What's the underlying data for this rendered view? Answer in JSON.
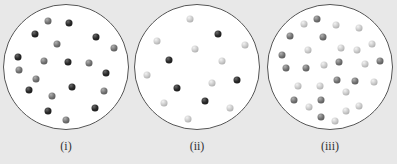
{
  "diagram": {
    "panels": [
      {
        "label": "(i)",
        "circle": {
          "cx": 66,
          "cy": 67,
          "r": 63
        },
        "particles": [
          {
            "x": 69,
            "y": 23,
            "type": "dark"
          },
          {
            "x": 35,
            "y": 34,
            "type": "dark"
          },
          {
            "x": 96,
            "y": 37,
            "type": "dark"
          },
          {
            "x": 18,
            "y": 57,
            "type": "dark"
          },
          {
            "x": 68,
            "y": 62,
            "type": "dark"
          },
          {
            "x": 106,
            "y": 73,
            "type": "dark"
          },
          {
            "x": 29,
            "y": 90,
            "type": "dark"
          },
          {
            "x": 72,
            "y": 87,
            "type": "dark"
          },
          {
            "x": 48,
            "y": 111,
            "type": "dark"
          },
          {
            "x": 95,
            "y": 108,
            "type": "dark"
          },
          {
            "x": 48,
            "y": 21,
            "type": "medium"
          },
          {
            "x": 57,
            "y": 44,
            "type": "medium"
          },
          {
            "x": 114,
            "y": 48,
            "type": "medium"
          },
          {
            "x": 44,
            "y": 61,
            "type": "medium"
          },
          {
            "x": 89,
            "y": 63,
            "type": "medium"
          },
          {
            "x": 19,
            "y": 70,
            "type": "medium"
          },
          {
            "x": 36,
            "y": 79,
            "type": "medium"
          },
          {
            "x": 104,
            "y": 91,
            "type": "medium"
          },
          {
            "x": 52,
            "y": 96,
            "type": "medium"
          },
          {
            "x": 66,
            "y": 120,
            "type": "medium"
          }
        ]
      },
      {
        "label": "(ii)",
        "circle": {
          "cx": 197,
          "cy": 67,
          "r": 63
        },
        "particles": [
          {
            "x": 218,
            "y": 34,
            "type": "dark"
          },
          {
            "x": 169,
            "y": 60,
            "type": "dark"
          },
          {
            "x": 237,
            "y": 80,
            "type": "dark"
          },
          {
            "x": 177,
            "y": 88,
            "type": "dark"
          },
          {
            "x": 205,
            "y": 101,
            "type": "dark"
          },
          {
            "x": 190,
            "y": 19,
            "type": "light"
          },
          {
            "x": 157,
            "y": 41,
            "type": "light"
          },
          {
            "x": 245,
            "y": 45,
            "type": "light"
          },
          {
            "x": 195,
            "y": 49,
            "type": "light"
          },
          {
            "x": 222,
            "y": 61,
            "type": "light"
          },
          {
            "x": 147,
            "y": 75,
            "type": "light"
          },
          {
            "x": 212,
            "y": 83,
            "type": "light"
          },
          {
            "x": 164,
            "y": 103,
            "type": "light"
          },
          {
            "x": 230,
            "y": 108,
            "type": "light"
          },
          {
            "x": 188,
            "y": 119,
            "type": "light"
          }
        ]
      },
      {
        "label": "(iii)",
        "circle": {
          "cx": 330,
          "cy": 67,
          "r": 63
        },
        "particles": [
          {
            "x": 317,
            "y": 19,
            "type": "medium"
          },
          {
            "x": 304,
            "y": 24,
            "type": "light"
          },
          {
            "x": 336,
            "y": 25,
            "type": "light"
          },
          {
            "x": 359,
            "y": 28,
            "type": "light"
          },
          {
            "x": 290,
            "y": 36,
            "type": "medium"
          },
          {
            "x": 323,
            "y": 37,
            "type": "medium"
          },
          {
            "x": 372,
            "y": 44,
            "type": "light"
          },
          {
            "x": 308,
            "y": 50,
            "type": "light"
          },
          {
            "x": 341,
            "y": 48,
            "type": "light"
          },
          {
            "x": 357,
            "y": 50,
            "type": "light"
          },
          {
            "x": 282,
            "y": 55,
            "type": "medium"
          },
          {
            "x": 380,
            "y": 61,
            "type": "medium"
          },
          {
            "x": 286,
            "y": 68,
            "type": "medium"
          },
          {
            "x": 306,
            "y": 68,
            "type": "medium"
          },
          {
            "x": 324,
            "y": 65,
            "type": "light"
          },
          {
            "x": 339,
            "y": 62,
            "type": "medium"
          },
          {
            "x": 365,
            "y": 64,
            "type": "light"
          },
          {
            "x": 298,
            "y": 86,
            "type": "light"
          },
          {
            "x": 320,
            "y": 86,
            "type": "light"
          },
          {
            "x": 337,
            "y": 80,
            "type": "medium"
          },
          {
            "x": 355,
            "y": 81,
            "type": "medium"
          },
          {
            "x": 374,
            "y": 82,
            "type": "light"
          },
          {
            "x": 346,
            "y": 92,
            "type": "light"
          },
          {
            "x": 294,
            "y": 100,
            "type": "medium"
          },
          {
            "x": 309,
            "y": 107,
            "type": "light"
          },
          {
            "x": 321,
            "y": 100,
            "type": "medium"
          },
          {
            "x": 346,
            "y": 111,
            "type": "light"
          },
          {
            "x": 359,
            "y": 106,
            "type": "light"
          },
          {
            "x": 321,
            "y": 117,
            "type": "medium"
          },
          {
            "x": 335,
            "y": 121,
            "type": "light"
          }
        ]
      }
    ],
    "colors": {
      "background": "#e8e8e8",
      "circle_fill": "#ffffff",
      "circle_border": "#555555",
      "dark_particle": "#2a2a2a",
      "medium_particle": "#707070",
      "light_particle": "#c8c8c8",
      "label_text": "#333333"
    }
  }
}
